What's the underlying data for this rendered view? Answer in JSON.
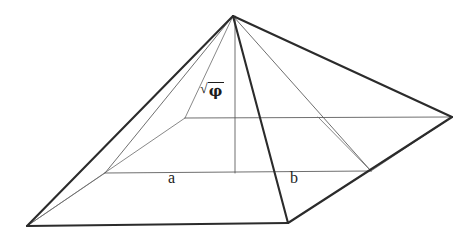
{
  "figure": {
    "background_color": "#ffffff",
    "line_color": "#2b2b2b",
    "inner_line_color": "#555555"
  },
  "labels": {
    "base_half_label": "a",
    "slant_label": "b",
    "height_radical": "√",
    "height_radicand": "φ",
    "height_label": "√φ"
  },
  "geometry": {
    "apex": {
      "x": 233,
      "y": 16,
      "name": "apex"
    },
    "corner_left": {
      "x": 27,
      "y": 226,
      "name": "left-base-corner"
    },
    "corner_front": {
      "x": 288,
      "y": 223,
      "name": "front-base-corner"
    },
    "corner_right": {
      "x": 452,
      "y": 117,
      "name": "right-base-corner"
    },
    "corner_back": {
      "x": 185,
      "y": 118,
      "name": "back-base-corner"
    },
    "base_center": {
      "x": 235,
      "y": 173,
      "name": "base-center"
    },
    "mid_left": {
      "x": 105,
      "y": 173,
      "name": "left-midpoint"
    },
    "mid_right": {
      "x": 371,
      "y": 171,
      "name": "right-midpoint"
    },
    "back_mid": {
      "x": 318,
      "y": 117,
      "name": "back-right-midpoint"
    }
  },
  "edges": {
    "outer": [
      {
        "name": "apex-to-left-corner",
        "from": "apex",
        "to": "corner_left"
      },
      {
        "name": "apex-to-front-corner",
        "from": "apex",
        "to": "corner_front"
      },
      {
        "name": "apex-to-right-corner",
        "from": "apex",
        "to": "corner_right"
      },
      {
        "name": "base-left-to-front",
        "from": "corner_left",
        "to": "corner_front"
      },
      {
        "name": "base-front-to-right",
        "from": "corner_front",
        "to": "corner_right"
      }
    ],
    "hidden": [
      {
        "name": "apex-to-back-corner",
        "from": "apex",
        "to": "corner_back"
      },
      {
        "name": "base-left-to-back",
        "from": "corner_left",
        "to": "corner_back"
      },
      {
        "name": "base-back-to-right",
        "from": "corner_back",
        "to": "corner_right"
      }
    ],
    "construction": [
      {
        "name": "vertical-height-axis",
        "from": "apex",
        "to": "base_center"
      },
      {
        "name": "base-midline-horizontal",
        "from": "mid_left",
        "to": "mid_right"
      },
      {
        "name": "apex-to-left-midpoint",
        "from": "apex",
        "to": "mid_left"
      },
      {
        "name": "apex-to-right-midpoint",
        "from": "apex",
        "to": "mid_right"
      }
    ]
  }
}
